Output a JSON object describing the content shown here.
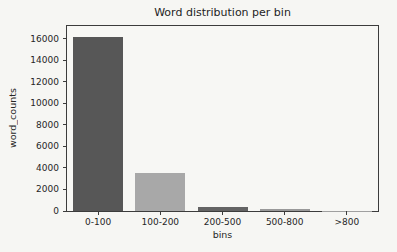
{
  "figure": {
    "background_color": "#f6f6f3",
    "axis_color": "#3c3c3c",
    "text_color": "#262626"
  },
  "chart_data": {
    "type": "bar",
    "title": "Word distribution per bin",
    "xlabel": "bins",
    "ylabel": "word_counts",
    "categories": [
      "0-100",
      "100-200",
      "200-500",
      "500-800",
      ">800"
    ],
    "values": [
      16200,
      3500,
      400,
      150,
      30
    ],
    "bar_colors": [
      "#575757",
      "#a8a8a8",
      "#646464",
      "#999999",
      "#a0a0a0"
    ],
    "ylim": [
      0,
      17200
    ],
    "yticks": [
      0,
      2000,
      4000,
      6000,
      8000,
      10000,
      12000,
      14000,
      16000
    ],
    "grid": false,
    "legend_position": "none"
  }
}
